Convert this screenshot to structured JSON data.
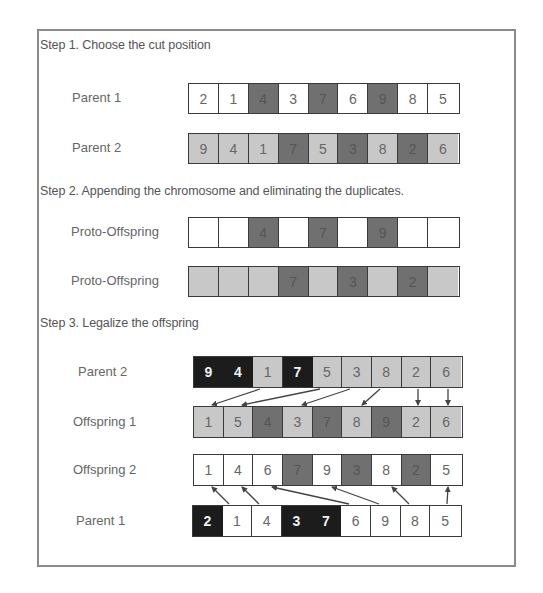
{
  "colors": {
    "white": "#ffffff",
    "light": "#c8c8c8",
    "dark": "#707070",
    "black": "#1c1c1c",
    "frame": "#8a8a8a",
    "arrow": "#444444"
  },
  "step1": {
    "title": "Step 1. Choose the cut position",
    "parent1": {
      "label": "Parent 1",
      "cells": [
        {
          "v": "2",
          "c": "white"
        },
        {
          "v": "1",
          "c": "white"
        },
        {
          "v": "4",
          "c": "dark"
        },
        {
          "v": "3",
          "c": "white"
        },
        {
          "v": "7",
          "c": "dark"
        },
        {
          "v": "6",
          "c": "white"
        },
        {
          "v": "9",
          "c": "dark"
        },
        {
          "v": "8",
          "c": "white"
        },
        {
          "v": "5",
          "c": "white"
        }
      ]
    },
    "parent2": {
      "label": "Parent 2",
      "cells": [
        {
          "v": "9",
          "c": "light"
        },
        {
          "v": "4",
          "c": "light"
        },
        {
          "v": "1",
          "c": "light"
        },
        {
          "v": "7",
          "c": "dark"
        },
        {
          "v": "5",
          "c": "light"
        },
        {
          "v": "3",
          "c": "dark"
        },
        {
          "v": "8",
          "c": "light"
        },
        {
          "v": "2",
          "c": "dark"
        },
        {
          "v": "6",
          "c": "light"
        }
      ]
    }
  },
  "step2": {
    "title": "Step 2. Appending the chromosome and eliminating the duplicates.",
    "proto1": {
      "label": "Proto-Offspring",
      "cells": [
        {
          "v": "",
          "c": "white"
        },
        {
          "v": "",
          "c": "white"
        },
        {
          "v": "4",
          "c": "dark"
        },
        {
          "v": "",
          "c": "white"
        },
        {
          "v": "7",
          "c": "dark"
        },
        {
          "v": "",
          "c": "white"
        },
        {
          "v": "9",
          "c": "dark"
        },
        {
          "v": "",
          "c": "white"
        },
        {
          "v": "",
          "c": "white"
        }
      ]
    },
    "proto2": {
      "label": "Proto-Offspring",
      "cells": [
        {
          "v": "",
          "c": "light"
        },
        {
          "v": "",
          "c": "light"
        },
        {
          "v": "",
          "c": "light"
        },
        {
          "v": "7",
          "c": "dark"
        },
        {
          "v": "",
          "c": "light"
        },
        {
          "v": "3",
          "c": "dark"
        },
        {
          "v": "",
          "c": "light"
        },
        {
          "v": "2",
          "c": "dark"
        },
        {
          "v": "",
          "c": "light"
        }
      ]
    }
  },
  "step3": {
    "title": "Step 3. Legalize the offspring",
    "parent2": {
      "label": "Parent 2",
      "cells": [
        {
          "v": "9",
          "c": "black"
        },
        {
          "v": "4",
          "c": "black"
        },
        {
          "v": "1",
          "c": "light"
        },
        {
          "v": "7",
          "c": "black"
        },
        {
          "v": "5",
          "c": "light"
        },
        {
          "v": "3",
          "c": "light"
        },
        {
          "v": "8",
          "c": "light"
        },
        {
          "v": "2",
          "c": "light"
        },
        {
          "v": "6",
          "c": "light"
        }
      ]
    },
    "offspring1": {
      "label": "Offspring 1",
      "cells": [
        {
          "v": "1",
          "c": "light"
        },
        {
          "v": "5",
          "c": "light"
        },
        {
          "v": "4",
          "c": "dark"
        },
        {
          "v": "3",
          "c": "light"
        },
        {
          "v": "7",
          "c": "dark"
        },
        {
          "v": "8",
          "c": "light"
        },
        {
          "v": "9",
          "c": "dark"
        },
        {
          "v": "2",
          "c": "light"
        },
        {
          "v": "6",
          "c": "light"
        }
      ]
    },
    "offspring2": {
      "label": "Offspring 2",
      "cells": [
        {
          "v": "1",
          "c": "white"
        },
        {
          "v": "4",
          "c": "white"
        },
        {
          "v": "6",
          "c": "white"
        },
        {
          "v": "7",
          "c": "dark"
        },
        {
          "v": "9",
          "c": "white"
        },
        {
          "v": "3",
          "c": "dark"
        },
        {
          "v": "8",
          "c": "white"
        },
        {
          "v": "2",
          "c": "dark"
        },
        {
          "v": "5",
          "c": "white"
        }
      ]
    },
    "parent1": {
      "label": "Parent 1",
      "cells": [
        {
          "v": "2",
          "c": "black"
        },
        {
          "v": "1",
          "c": "white"
        },
        {
          "v": "4",
          "c": "white"
        },
        {
          "v": "3",
          "c": "black"
        },
        {
          "v": "7",
          "c": "black"
        },
        {
          "v": "6",
          "c": "white"
        },
        {
          "v": "9",
          "c": "white"
        },
        {
          "v": "8",
          "c": "white"
        },
        {
          "v": "5",
          "c": "white"
        }
      ]
    },
    "arrows_p2_to_o1": [
      [
        2,
        0
      ],
      [
        4,
        1
      ],
      [
        5,
        3
      ],
      [
        6,
        5
      ],
      [
        7,
        7
      ],
      [
        8,
        8
      ]
    ],
    "arrows_p1_to_o2": [
      [
        1,
        0
      ],
      [
        2,
        1
      ],
      [
        5,
        2
      ],
      [
        6,
        4
      ],
      [
        7,
        6
      ],
      [
        8,
        8
      ]
    ]
  }
}
